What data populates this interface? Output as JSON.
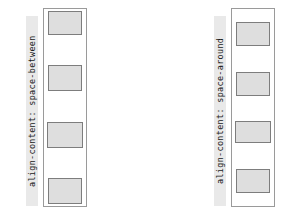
{
  "figure": {
    "type": "css-flexbox-align-content-demo",
    "background_color": "#ffffff",
    "width": 282,
    "height": 221
  },
  "style": {
    "label_background": "#e9e9e9",
    "label_text_color": "#1a1a1a",
    "container_border_color": "#9a9a9a",
    "item_fill_color": "#dedede",
    "item_border_color": "#7d7d7d"
  },
  "panels": [
    {
      "id": "space-between",
      "label": "align-content: space-between",
      "item_count": 4,
      "items": [
        {
          "name": "item-1"
        },
        {
          "name": "item-2"
        },
        {
          "name": "item-3"
        },
        {
          "name": "item-4"
        }
      ]
    },
    {
      "id": "space-around",
      "label": "align-content: space-around",
      "item_count": 4,
      "items": [
        {
          "name": "item-1"
        },
        {
          "name": "item-2"
        },
        {
          "name": "item-3"
        },
        {
          "name": "item-4"
        }
      ]
    },
    {
      "id": "space-evenly",
      "label": "align-content: space-evenly",
      "item_count": 4,
      "items": [
        {
          "name": "item-1"
        },
        {
          "name": "item-2"
        },
        {
          "name": "item-3"
        },
        {
          "name": "item-4"
        }
      ]
    }
  ]
}
